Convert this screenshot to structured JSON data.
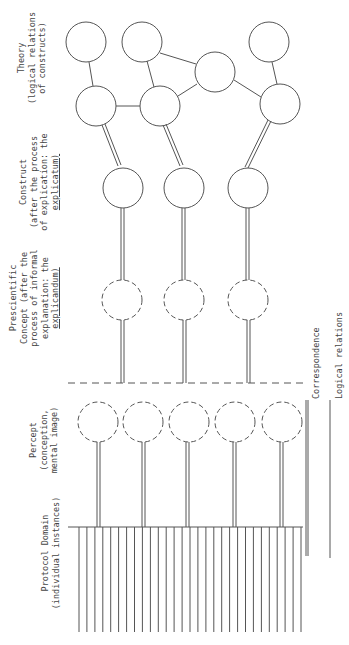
{
  "labels": {
    "theory": {
      "line1": "Theory",
      "line2": "(logical relations",
      "line3": "of constructs)"
    },
    "construct": {
      "line1": "Construct",
      "line2": "(after the process",
      "line3_pre": "of explication: the",
      "line4": "explicatum)"
    },
    "prescientific": {
      "line1": "Prescientific",
      "line2": "Concept (after the",
      "line3": "process of informal",
      "line4": "explanation: the",
      "line5": "explicandum)"
    },
    "percept": {
      "line1": "Percept",
      "line2": "(conception,",
      "line3": "mental image)"
    },
    "protocol": {
      "line1": "Protocol Domain",
      "line2": "(individual instances)"
    }
  },
  "legend": {
    "correspondence": "Correspondence",
    "logical_relations": "Logical relations"
  },
  "structure": {
    "theory_nodes": 7,
    "construct_nodes": 3,
    "prescientific_nodes": 3,
    "percept_nodes": 5,
    "protocol_instances": 29
  },
  "colors": {
    "line": "#555555",
    "text": "#444444",
    "background": "#ffffff"
  }
}
